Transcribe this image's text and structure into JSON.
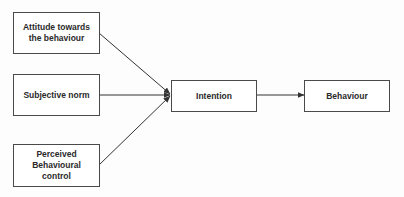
{
  "diagram": {
    "type": "flowchart",
    "nodes": [
      {
        "id": "attitude",
        "label": "Attitude towards the behaviour"
      },
      {
        "id": "subjective_norm",
        "label": "Subjective norm"
      },
      {
        "id": "pbc",
        "label": "Perceived Behavioural control"
      },
      {
        "id": "intention",
        "label": "Intention"
      },
      {
        "id": "behaviour",
        "label": "Behaviour"
      }
    ],
    "edges": [
      {
        "from": "attitude",
        "to": "intention"
      },
      {
        "from": "subjective_norm",
        "to": "intention"
      },
      {
        "from": "pbc",
        "to": "intention"
      },
      {
        "from": "intention",
        "to": "behaviour"
      }
    ]
  },
  "colors": {
    "stroke": "#333333",
    "text": "#2a2a2a",
    "background": "#ffffff"
  }
}
